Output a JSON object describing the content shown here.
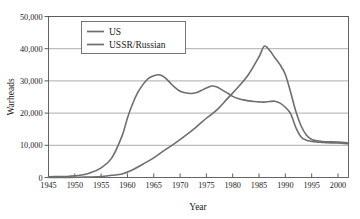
{
  "chart_data": {
    "type": "line",
    "title": "",
    "xlabel": "Year",
    "ylabel": "Warheads",
    "xlim": [
      1945,
      2002
    ],
    "ylim": [
      0,
      50000
    ],
    "grid": true,
    "legend_position": "top-left",
    "xticks": [
      1945,
      1950,
      1955,
      1960,
      1965,
      1970,
      1975,
      1980,
      1985,
      1990,
      1995,
      2000
    ],
    "xtick_labels": [
      "1945",
      "1950",
      "1955",
      "1960",
      "1965",
      "1970",
      "1975",
      "1980",
      "1985",
      "1990",
      "1995",
      "2000"
    ],
    "yticks": [
      0,
      10000,
      20000,
      30000,
      40000,
      50000
    ],
    "ytick_labels": [
      "0",
      "10,000",
      "20,000",
      "30,000",
      "40,000",
      "50,000"
    ],
    "series": [
      {
        "name": "US",
        "color": "#6e6e6e",
        "x": [
          1945,
          1947,
          1949,
          1951,
          1953,
          1955,
          1957,
          1959,
          1960,
          1961,
          1962,
          1963,
          1964,
          1965,
          1966,
          1967,
          1968,
          1969,
          1970,
          1971,
          1972,
          1973,
          1974,
          1975,
          1976,
          1977,
          1978,
          1979,
          1980,
          1981,
          1982,
          1983,
          1984,
          1985,
          1986,
          1987,
          1988,
          1989,
          1990,
          1991,
          1992,
          1993,
          1994,
          1995,
          1996,
          1997,
          1998,
          2000,
          2002
        ],
        "values": [
          200,
          300,
          400,
          700,
          1500,
          3000,
          6000,
          13000,
          18500,
          23000,
          26500,
          29000,
          30800,
          31600,
          31900,
          31200,
          29600,
          28000,
          26800,
          26300,
          26100,
          26300,
          27000,
          27800,
          28400,
          28100,
          27200,
          26200,
          25200,
          24500,
          24100,
          23800,
          23600,
          23500,
          23400,
          23600,
          23700,
          23100,
          21800,
          19800,
          15500,
          12600,
          11600,
          11200,
          11000,
          10900,
          10800,
          10700,
          10500
        ]
      },
      {
        "name": "USSR/Russian",
        "color": "#6e6e6e",
        "x": [
          1945,
          1949,
          1951,
          1953,
          1955,
          1957,
          1959,
          1961,
          1963,
          1965,
          1967,
          1969,
          1971,
          1973,
          1975,
          1977,
          1979,
          1981,
          1983,
          1985,
          1986,
          1987,
          1988,
          1989,
          1990,
          1991,
          1992,
          1993,
          1994,
          1995,
          1996,
          1997,
          1998,
          2000,
          2002
        ],
        "values": [
          0,
          50,
          100,
          150,
          300,
          700,
          1100,
          2400,
          4200,
          6100,
          8400,
          10600,
          13000,
          15600,
          18400,
          21000,
          24500,
          28000,
          32000,
          37500,
          40800,
          39500,
          37200,
          35000,
          32000,
          26500,
          20500,
          16000,
          13200,
          11800,
          11400,
          11200,
          11100,
          11000,
          10700
        ]
      }
    ]
  },
  "legend": {
    "entries": [
      {
        "label": "US"
      },
      {
        "label": "USSR/Russian"
      }
    ]
  },
  "colors": {
    "line": "#6e6e6e",
    "grid": "#8a8a8a",
    "frame": "#555555",
    "text": "#1a1a1a",
    "background": "#ffffff"
  }
}
